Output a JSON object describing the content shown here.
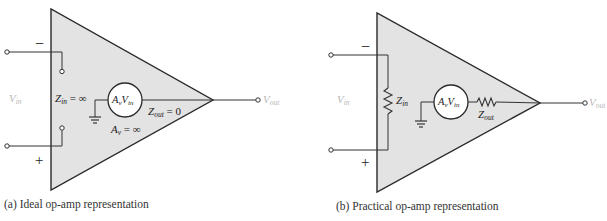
{
  "diagram_a": {
    "caption": "(a) Ideal op-amp representation",
    "minus_sign": "−",
    "plus_sign": "+",
    "vin": {
      "base": "V",
      "sub": "in"
    },
    "vout": {
      "base": "V",
      "sub": "out"
    },
    "zin": {
      "base": "Z",
      "sub": "in",
      "rest": " = ∞"
    },
    "zout": {
      "base": "Z",
      "sub": "out",
      "rest": " = 0"
    },
    "av": {
      "base": "A",
      "sub": "v",
      "rest": " = ∞"
    },
    "source": {
      "a": "A",
      "a_sub": "v",
      "v": "V",
      "v_sub": "in"
    }
  },
  "diagram_b": {
    "caption": "(b) Practical op-amp representation",
    "minus_sign": "−",
    "plus_sign": "+",
    "vin": {
      "base": "V",
      "sub": "in"
    },
    "vout": {
      "base": "V",
      "sub": "out"
    },
    "zin": {
      "base": "Z",
      "sub": "in"
    },
    "zout": {
      "base": "Z",
      "sub": "out"
    },
    "source": {
      "a": "A",
      "a_sub": "v",
      "v": "V",
      "v_sub": "in"
    }
  },
  "colors": {
    "triangle_fill": "#e3e3e3",
    "stroke": "#2a2a2a",
    "faint_label": "#b8b8b8"
  }
}
